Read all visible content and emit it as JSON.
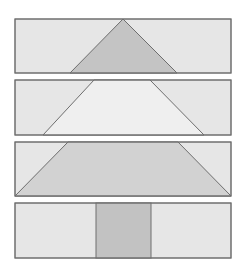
{
  "diagram": {
    "colors": {
      "background": "#ffffff",
      "panel_fill": "#e6e6e6",
      "stroke": "#6e6e6e",
      "triangle_fill": "#c4c4c4",
      "trapezoid_light_fill": "#efefef",
      "trapezoid_dark_fill": "#d2d2d2",
      "rectangle_fill": "#c2c2c2"
    },
    "panels": [
      {
        "name": "triangle-panel",
        "x": 15,
        "y": 19,
        "w": 216,
        "h": 54,
        "shape": "triangle",
        "points": "123,19 70,73 177,73"
      },
      {
        "name": "light-trapezoid-panel",
        "x": 15,
        "y": 80,
        "w": 216,
        "h": 55,
        "shape": "trapezoid",
        "points": "94,80 150,80 204,135 43,135"
      },
      {
        "name": "wide-trapezoid-panel",
        "x": 15,
        "y": 142,
        "w": 216,
        "h": 54,
        "shape": "trapezoid",
        "points": "68,142 178,142 231,196 15,196"
      },
      {
        "name": "rectangle-panel",
        "x": 15,
        "y": 203,
        "w": 216,
        "h": 55,
        "shape": "rectangle",
        "rect": {
          "x": 96,
          "y": 203,
          "w": 55,
          "h": 55
        }
      }
    ]
  }
}
